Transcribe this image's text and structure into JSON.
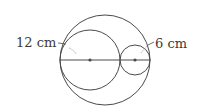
{
  "diagram": {
    "type": "geometry",
    "colors": {
      "stroke": "#4a4a4a",
      "text": "#3a3a3a",
      "background": "#ffffff"
    },
    "labels": {
      "large_inner_circle_radius": "12 cm",
      "small_inner_circle_radius": "6 cm"
    },
    "shapes": {
      "outer_circle": {
        "cx": 105,
        "cy": 60,
        "r": 45
      },
      "left_circle": {
        "cx": 90,
        "cy": 60,
        "r": 30
      },
      "right_circle": {
        "cx": 135,
        "cy": 60,
        "r": 15
      },
      "diameter": {
        "x1": 60,
        "y1": 60,
        "x2": 150,
        "y2": 60
      }
    }
  }
}
